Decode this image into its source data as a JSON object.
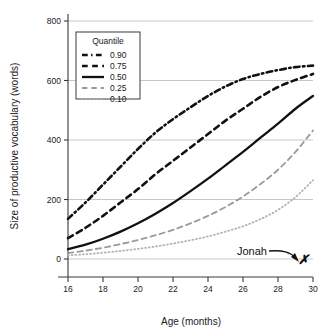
{
  "chart_data": {
    "type": "line",
    "title": "",
    "xlabel": "Age (months)",
    "ylabel": "Size of productive vocabulary (words)",
    "xlim": [
      15.2,
      30.6
    ],
    "ylim": [
      -40,
      810
    ],
    "xticks": [
      16,
      18,
      20,
      22,
      24,
      26,
      28,
      30
    ],
    "yticks": [
      0,
      200,
      400,
      600,
      800
    ],
    "grid": "horizontal",
    "legend": {
      "title": "Quantile",
      "position": "upper-left-inside",
      "entries": [
        {
          "label": "0.90",
          "dash": "dashdot",
          "color": "#111111"
        },
        {
          "label": "0.75",
          "dash": "dashed",
          "color": "#111111"
        },
        {
          "label": "0.50",
          "dash": "solid",
          "color": "#111111"
        },
        {
          "label": "0.25",
          "dash": "longdash",
          "color": "#9a9a9a"
        },
        {
          "label": "0.10",
          "dash": "dotted",
          "color": "#b4b4b4"
        }
      ]
    },
    "x": [
      16,
      17,
      18,
      19,
      20,
      21,
      22,
      23,
      24,
      25,
      26,
      27,
      28,
      29,
      30
    ],
    "series": [
      {
        "name": "0.90",
        "dash": "dashdot",
        "color": "#111111",
        "width": 2.6,
        "values": [
          135,
          190,
          250,
          310,
          370,
          425,
          470,
          510,
          548,
          580,
          605,
          622,
          635,
          645,
          650
        ]
      },
      {
        "name": "0.75",
        "dash": "dashed",
        "color": "#111111",
        "width": 2.6,
        "values": [
          70,
          105,
          145,
          190,
          235,
          285,
          330,
          375,
          420,
          465,
          505,
          545,
          578,
          602,
          622
        ]
      },
      {
        "name": "0.50",
        "dash": "solid",
        "color": "#111111",
        "width": 2.3,
        "values": [
          33,
          48,
          68,
          92,
          120,
          152,
          188,
          228,
          270,
          315,
          360,
          408,
          455,
          505,
          548
        ]
      },
      {
        "name": "0.25",
        "dash": "longdash",
        "color": "#9a9a9a",
        "width": 1.8,
        "values": [
          20,
          28,
          38,
          50,
          64,
          80,
          98,
          120,
          145,
          175,
          210,
          252,
          300,
          360,
          432
        ]
      },
      {
        "name": "0.10",
        "dash": "dotted",
        "color": "#b4b4b4",
        "width": 1.8,
        "values": [
          12,
          16,
          21,
          27,
          34,
          42,
          52,
          63,
          76,
          92,
          110,
          134,
          165,
          208,
          265
        ]
      }
    ],
    "annotations": [
      {
        "text": "Jonah",
        "kind": "arrow-label",
        "points_to": {
          "x": 30,
          "y": 30
        },
        "marker": "✗"
      }
    ]
  }
}
